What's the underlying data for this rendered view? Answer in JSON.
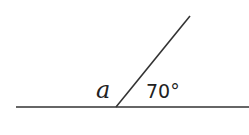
{
  "diagram": {
    "type": "angle-on-straight-line",
    "labels": {
      "unknown_angle": "a",
      "known_angle": "70°"
    },
    "colors": {
      "line": "#333333",
      "text": "#222222",
      "background": "#ffffff"
    },
    "geometry": {
      "baseline": {
        "x1": 16,
        "y1": 107,
        "x2": 249,
        "y2": 107
      },
      "ray": {
        "x1": 116,
        "y1": 107,
        "x2": 190,
        "y2": 16
      }
    }
  }
}
